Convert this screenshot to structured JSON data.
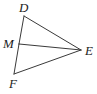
{
  "figure": {
    "background_color": "#ffffff",
    "stroke_color": "#3a3a3a",
    "label_color": "#1c1c1c",
    "width": 97,
    "height": 94,
    "points": {
      "D": {
        "label": "D",
        "x": 24,
        "y": 16
      },
      "M": {
        "label": "M",
        "x": 19,
        "y": 44
      },
      "F": {
        "label": "F",
        "x": 14,
        "y": 74
      },
      "E": {
        "label": "E",
        "x": 81,
        "y": 50
      }
    },
    "segments": [
      {
        "name": "segment-DM",
        "from": "D",
        "to": "M"
      },
      {
        "name": "segment-MF",
        "from": "M",
        "to": "F"
      },
      {
        "name": "segment-DE",
        "from": "D",
        "to": "E"
      },
      {
        "name": "segment-ME",
        "from": "M",
        "to": "E"
      },
      {
        "name": "segment-FE",
        "from": "F",
        "to": "E"
      }
    ]
  }
}
